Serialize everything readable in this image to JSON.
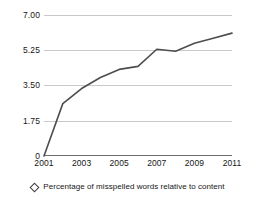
{
  "chart_data": {
    "type": "line",
    "title": "",
    "subtitle": "",
    "xlabel": "",
    "ylabel": "",
    "x": [
      2001,
      2002,
      2003,
      2004,
      2005,
      2006,
      2007,
      2008,
      2009,
      2010,
      2011
    ],
    "series": [
      {
        "name": "Percentage of misspelled words relative to content",
        "values": [
          0,
          2.6,
          3.35,
          3.9,
          4.3,
          4.45,
          5.3,
          5.2,
          5.6,
          5.85,
          6.1
        ],
        "color": "#4d4d4d",
        "marker": "diamond-open"
      }
    ],
    "xlim": [
      2001,
      2011
    ],
    "ylim": [
      0,
      7.0
    ],
    "y_ticks": [
      0,
      1.75,
      3.5,
      5.25,
      7.0
    ],
    "y_tick_labels": [
      "0",
      "1.75",
      "3.50",
      "5.25",
      "7.00"
    ],
    "x_ticks": [
      2001,
      2003,
      2005,
      2007,
      2009,
      2011
    ],
    "x_tick_labels": [
      "2001",
      "2003",
      "2005",
      "2007",
      "2009",
      "2011"
    ],
    "grid": "horizontal",
    "legend_position": "bottom",
    "legend": [
      {
        "label": "Percentage of misspelled words relative to content",
        "marker": "diamond-open"
      }
    ],
    "colors": {
      "line": "#4d4d4d",
      "gridline": "#c9c9c9",
      "axis": "#6e6e6e",
      "text": "#161616",
      "background": "#ffffff"
    }
  }
}
